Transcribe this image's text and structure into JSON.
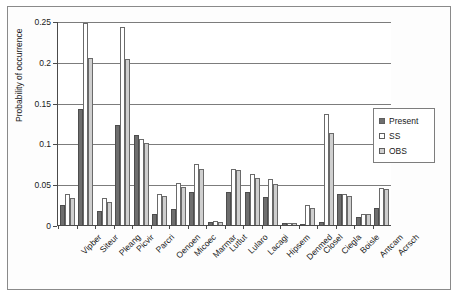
{
  "chart_data": {
    "type": "bar",
    "title": "",
    "xlabel": "",
    "ylabel": "Probability of occurrence",
    "ylim": [
      0,
      0.25
    ],
    "yticks": [
      0,
      0.05,
      0.1,
      0.15,
      0.2,
      0.25
    ],
    "ytick_labels": [
      "0",
      "0.05",
      "0.1",
      "0.15",
      "0.2",
      "0.25"
    ],
    "grid": true,
    "legend_position": "right",
    "categories": [
      "Vipber",
      "Siteur",
      "Pleang",
      "Picvir",
      "Parcri",
      "Oenoen",
      "Micoec",
      "Marmar",
      "Lutlut",
      "Lularo",
      "Lacagi",
      "Hipsem",
      "Denmed",
      "Closel",
      "Ciegla",
      "Boisle",
      "Antcam",
      "Acrsch"
    ],
    "series": [
      {
        "name": "Present",
        "color": "#6e6e6e",
        "values": [
          0.025,
          0.142,
          0.017,
          0.123,
          0.11,
          0.013,
          0.02,
          0.04,
          0.004,
          0.04,
          0.04,
          0.034,
          0.002,
          0.001,
          0.004,
          0.038,
          0.01,
          0.021
        ]
      },
      {
        "name": "SS",
        "color": "#ffffff",
        "values": [
          0.038,
          0.247,
          0.033,
          0.243,
          0.105,
          0.038,
          0.052,
          0.075,
          0.005,
          0.069,
          0.063,
          0.057,
          0.003,
          0.024,
          0.136,
          0.038,
          0.014,
          0.045
        ]
      },
      {
        "name": "OBS",
        "color": "#cfcfcf",
        "values": [
          0.033,
          0.205,
          0.028,
          0.204,
          0.1,
          0.035,
          0.046,
          0.069,
          0.004,
          0.068,
          0.058,
          0.05,
          0.002,
          0.021,
          0.113,
          0.036,
          0.013,
          0.044
        ]
      }
    ]
  },
  "legend": {
    "items": [
      {
        "label": "Present",
        "key": "present"
      },
      {
        "label": "SS",
        "key": "ss"
      },
      {
        "label": "OBS",
        "key": "obs"
      }
    ]
  }
}
